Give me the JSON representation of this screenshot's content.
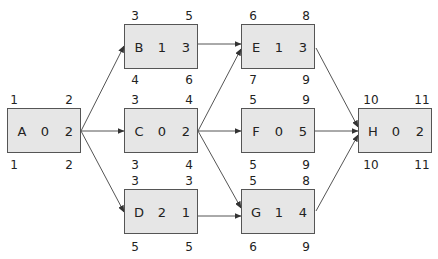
{
  "diagram": {
    "type": "activity-on-node network",
    "node_fields": [
      "name",
      "slack",
      "duration",
      "earliest_start",
      "earliest_finish",
      "latest_start",
      "latest_finish"
    ],
    "nodes": {
      "A": {
        "name": "A",
        "slack": "0",
        "duration": "2",
        "es": "1",
        "ef": "2",
        "ls": "1",
        "lf": "2",
        "x": 7,
        "y": 108
      },
      "B": {
        "name": "B",
        "slack": "1",
        "duration": "3",
        "es": "3",
        "ef": "5",
        "ls": "4",
        "lf": "6",
        "x": 124,
        "y": 24
      },
      "C": {
        "name": "C",
        "slack": "0",
        "duration": "2",
        "es": "3",
        "ef": "4",
        "ls": "3",
        "lf": "4",
        "x": 124,
        "y": 108
      },
      "D": {
        "name": "D",
        "slack": "2",
        "duration": "1",
        "es": "3",
        "ef": "3",
        "ls": "5",
        "lf": "5",
        "x": 124,
        "y": 189
      },
      "E": {
        "name": "E",
        "slack": "1",
        "duration": "3",
        "es": "6",
        "ef": "8",
        "ls": "7",
        "lf": "9",
        "x": 241,
        "y": 24
      },
      "F": {
        "name": "F",
        "slack": "0",
        "duration": "5",
        "es": "5",
        "ef": "9",
        "ls": "5",
        "lf": "9",
        "x": 241,
        "y": 108
      },
      "G": {
        "name": "G",
        "slack": "1",
        "duration": "4",
        "es": "5",
        "ef": "8",
        "ls": "6",
        "lf": "9",
        "x": 241,
        "y": 189
      },
      "H": {
        "name": "H",
        "slack": "0",
        "duration": "2",
        "es": "10",
        "ef": "11",
        "ls": "10",
        "lf": "11",
        "x": 358,
        "y": 108
      }
    },
    "edges": [
      {
        "from": "A",
        "to": "B"
      },
      {
        "from": "A",
        "to": "C"
      },
      {
        "from": "A",
        "to": "D"
      },
      {
        "from": "B",
        "to": "E"
      },
      {
        "from": "C",
        "to": "E"
      },
      {
        "from": "C",
        "to": "F"
      },
      {
        "from": "C",
        "to": "G"
      },
      {
        "from": "D",
        "to": "G"
      },
      {
        "from": "E",
        "to": "H"
      },
      {
        "from": "F",
        "to": "H"
      },
      {
        "from": "G",
        "to": "H"
      }
    ],
    "colors": {
      "node_fill": "#e6e6e6",
      "node_border": "#555555",
      "edge": "#444444"
    }
  }
}
